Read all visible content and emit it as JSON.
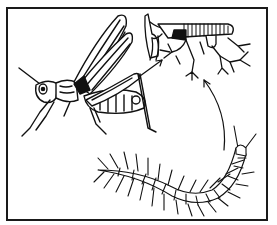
{
  "figure": {
    "caption": "",
    "colors": {
      "ink": "#111111",
      "background": "#ffffff",
      "frame": "#1a1a1a"
    },
    "elements": [
      {
        "id": "grasshopper",
        "label": ""
      },
      {
        "id": "tracheal-system",
        "label": ""
      },
      {
        "id": "centipede",
        "label": ""
      },
      {
        "id": "arrow-grasshopper-to-trachea",
        "label": ""
      },
      {
        "id": "arrow-centipede-to-trachea",
        "label": ""
      }
    ]
  }
}
